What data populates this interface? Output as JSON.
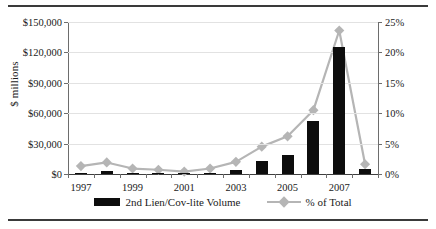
{
  "figure": {
    "ylabel_left": "$ millions",
    "legend": [
      {
        "label": "2nd Lien/Cov-lite Volume",
        "icon": "bar-swatch",
        "color": "#0d0d0d"
      },
      {
        "label": "% of Total",
        "icon": "line-swatch",
        "color": "#b5b5b5"
      }
    ]
  },
  "chart_data": {
    "type": "bar",
    "title": "",
    "xlabel": "",
    "ylabel": "$ millions",
    "categories": [
      "1997",
      "1998",
      "1999",
      "2000",
      "2001",
      "2002",
      "2003",
      "2004",
      "2005",
      "2006",
      "2007",
      "2008"
    ],
    "tick_labels_shown": [
      "1997",
      "1999",
      "2001",
      "2003",
      "2005",
      "2007"
    ],
    "ylim": [
      0,
      150000
    ],
    "yticks": [
      0,
      30000,
      60000,
      90000,
      120000,
      150000
    ],
    "ytick_labels": [
      "$0",
      "$30,000",
      "$60,000",
      "$90,000",
      "$120,000",
      "$150,000"
    ],
    "y2lim": [
      0,
      25
    ],
    "y2ticks": [
      0,
      5,
      10,
      15,
      20,
      25
    ],
    "y2tick_labels": [
      "0%",
      "5%",
      "10%",
      "15%",
      "20%",
      "25%"
    ],
    "grid": true,
    "legend_position": "bottom",
    "series": [
      {
        "name": "2nd Lien/Cov-lite Volume",
        "type": "bar",
        "axis": "left",
        "unit": "$ millions",
        "color": "#0d0d0d",
        "values": [
          900,
          3200,
          700,
          600,
          400,
          900,
          4000,
          12600,
          18500,
          52500,
          125500,
          5200
        ]
      },
      {
        "name": "% of Total",
        "type": "line",
        "axis": "right",
        "unit": "%",
        "color": "#b5b5b5",
        "marker": "diamond",
        "values": [
          1.3,
          1.9,
          0.9,
          0.7,
          0.4,
          0.9,
          2.0,
          4.5,
          6.2,
          10.5,
          23.6,
          1.6
        ]
      }
    ]
  }
}
